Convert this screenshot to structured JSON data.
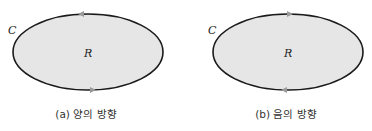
{
  "figures": [
    {
      "curve_label": "C",
      "region_label": "R",
      "caption": "(a) 양의 방향",
      "orientation": "counterclockwise",
      "top_arrow": "left",
      "bottom_arrow": "right"
    },
    {
      "curve_label": "C",
      "region_label": "R",
      "caption": "(b) 음의 방향",
      "orientation": "clockwise",
      "top_arrow": "right",
      "bottom_arrow": "left"
    }
  ],
  "colors": {
    "fill": "#e6e6e6",
    "stroke": "#1a1a1a",
    "arrow": "#9a9a9a"
  }
}
